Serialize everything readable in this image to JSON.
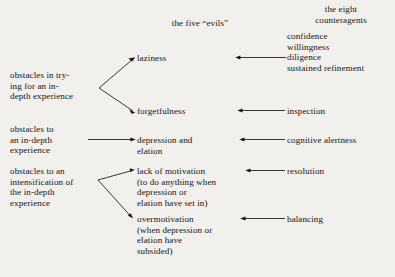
{
  "diagram": {
    "title_left": "",
    "headers": {
      "evils": "the five “evils”",
      "counteragents": "the eight\ncounteragents"
    },
    "obstacles": [
      {
        "id": "obstacle-trying",
        "text": "obstacles in trying\nfor an in-\ndepth experience",
        "text_lines": "obstacles in try-\ning for an in-\ndepth experience",
        "branches": 2
      },
      {
        "id": "obstacle-in-depth",
        "text": "obstacles to\nan in-depth\nexperience",
        "text_lines": "obstacles to\nan in-depth\nexperience",
        "branches": 1
      },
      {
        "id": "obstacle-intensification",
        "text": "obstacles to an\nintensification of\nthe in-depth\nexperience",
        "text_lines": "obstacles to an\nintensification of\nthe in-depth\nexperience",
        "branches": 2
      }
    ],
    "evils": [
      {
        "id": "evil-laziness",
        "label": "laziness"
      },
      {
        "id": "evil-forgetfulness",
        "label": "forgetfulness"
      },
      {
        "id": "evil-depression-elation",
        "label": "depression and\nelation"
      },
      {
        "id": "evil-lack-of-motivation",
        "label": "lack of motivation\n(to do anything when\ndepression or\nelation have set in)"
      },
      {
        "id": "evil-overmotivation",
        "label": "overmotivation\n(when depression or\nelation have\nsubsided)"
      }
    ],
    "counteragents": [
      {
        "id": "counteragent-group-1",
        "label": "confidence\nwillingness\ndiligence\nsustained refinement"
      },
      {
        "id": "counteragent-inspection",
        "label": "inspection"
      },
      {
        "id": "counteragent-cognitive-alertness",
        "label": "cognitive alertness"
      },
      {
        "id": "counteragent-resolution",
        "label": "resolution"
      },
      {
        "id": "counteragent-balancing",
        "label": "balancing"
      }
    ],
    "colors": {
      "background": "#f2f0ec",
      "text": "#161412",
      "line": "#17150f"
    }
  }
}
